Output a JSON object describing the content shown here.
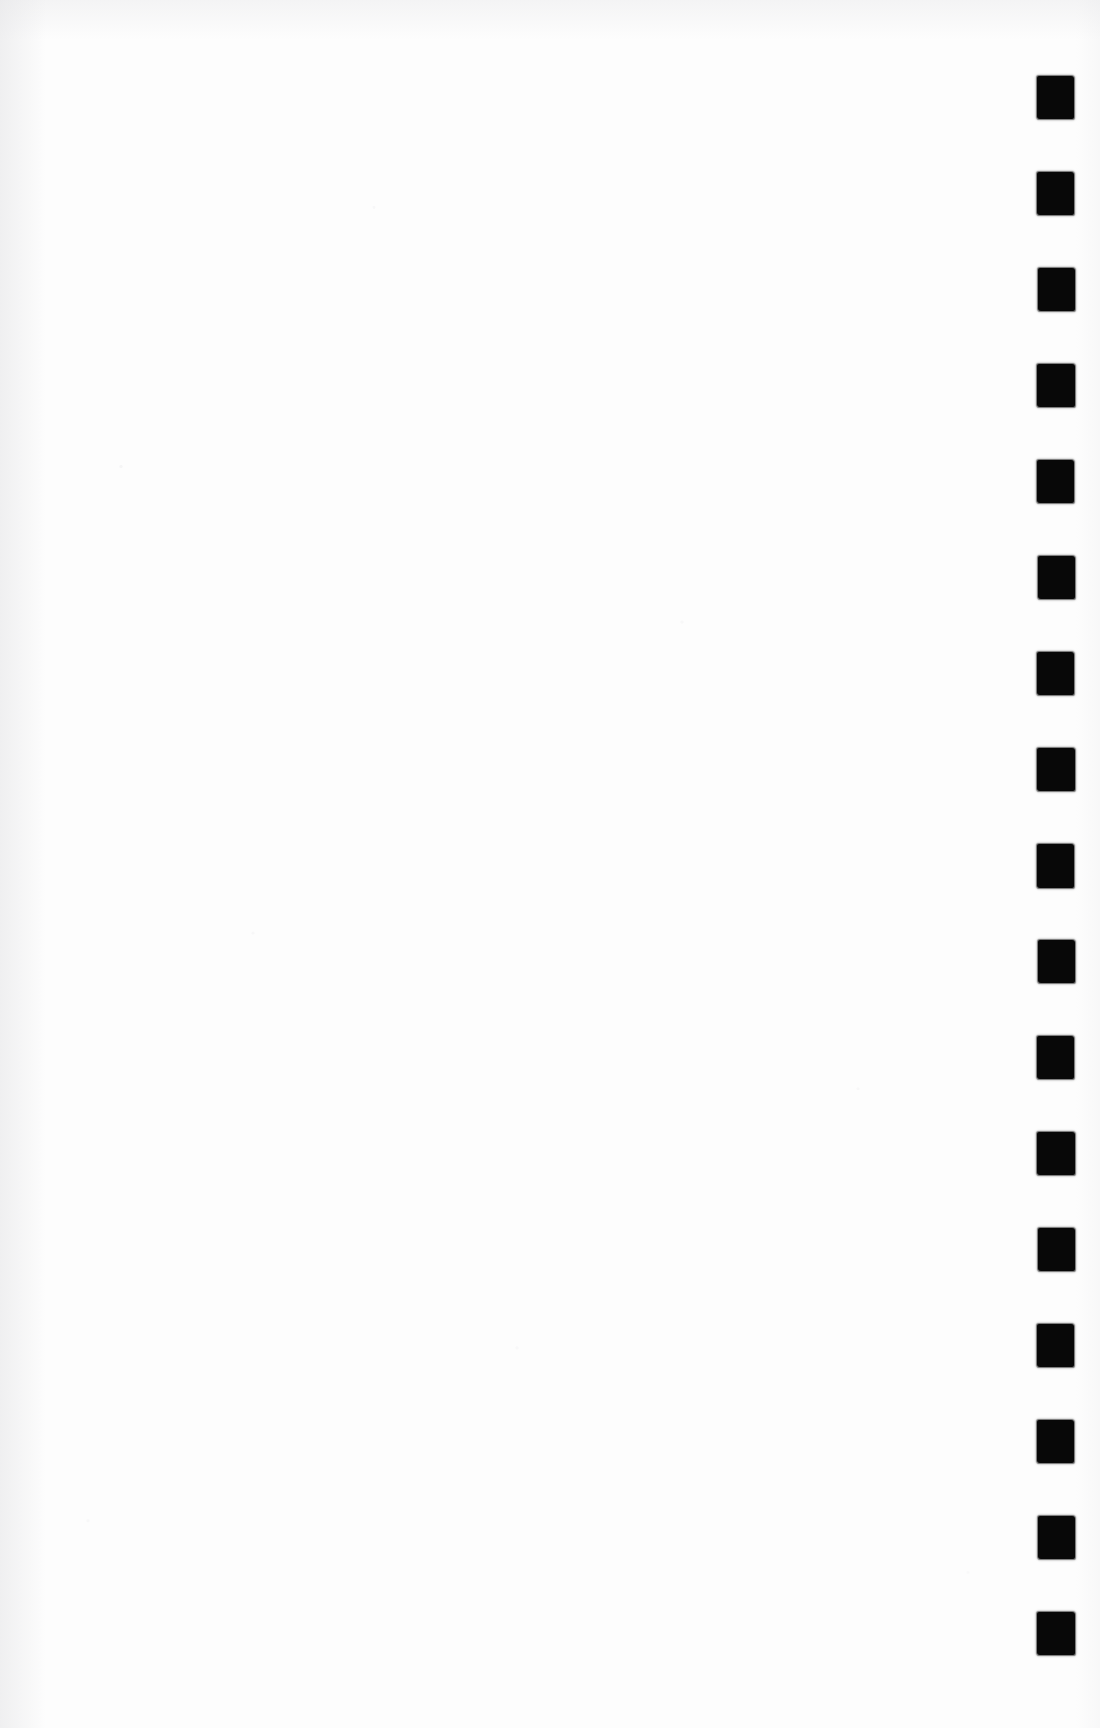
{
  "page": {
    "label": "Scanned document page",
    "width": 1100,
    "height": 1728,
    "paper_color": "#fdfdfd",
    "content_text": ""
  },
  "index_marks": {
    "label": "Edge index tab marks",
    "count": 17,
    "color": "#080808",
    "mark_width": 37,
    "mark_height": 43,
    "left": 1037,
    "first_top": 76,
    "pitch": 96,
    "items": [
      {
        "name": "index-mark-1",
        "top": 76,
        "left": 1037,
        "width": 37,
        "height": 43
      },
      {
        "name": "index-mark-2",
        "top": 172,
        "left": 1037,
        "width": 37,
        "height": 43
      },
      {
        "name": "index-mark-3",
        "top": 268,
        "left": 1038,
        "width": 37,
        "height": 43
      },
      {
        "name": "index-mark-4",
        "top": 364,
        "left": 1037,
        "width": 38,
        "height": 43
      },
      {
        "name": "index-mark-5",
        "top": 460,
        "left": 1037,
        "width": 37,
        "height": 43
      },
      {
        "name": "index-mark-6",
        "top": 556,
        "left": 1038,
        "width": 37,
        "height": 43
      },
      {
        "name": "index-mark-7",
        "top": 652,
        "left": 1037,
        "width": 37,
        "height": 43
      },
      {
        "name": "index-mark-8",
        "top": 748,
        "left": 1037,
        "width": 38,
        "height": 43
      },
      {
        "name": "index-mark-9",
        "top": 844,
        "left": 1037,
        "width": 37,
        "height": 44
      },
      {
        "name": "index-mark-10",
        "top": 940,
        "left": 1038,
        "width": 37,
        "height": 43
      },
      {
        "name": "index-mark-11",
        "top": 1036,
        "left": 1037,
        "width": 37,
        "height": 43
      },
      {
        "name": "index-mark-12",
        "top": 1132,
        "left": 1037,
        "width": 38,
        "height": 43
      },
      {
        "name": "index-mark-13",
        "top": 1228,
        "left": 1038,
        "width": 37,
        "height": 43
      },
      {
        "name": "index-mark-14",
        "top": 1324,
        "left": 1037,
        "width": 37,
        "height": 43
      },
      {
        "name": "index-mark-15",
        "top": 1420,
        "left": 1037,
        "width": 37,
        "height": 43
      },
      {
        "name": "index-mark-16",
        "top": 1516,
        "left": 1038,
        "width": 37,
        "height": 43
      },
      {
        "name": "index-mark-17",
        "top": 1612,
        "left": 1037,
        "width": 38,
        "height": 43
      }
    ]
  }
}
